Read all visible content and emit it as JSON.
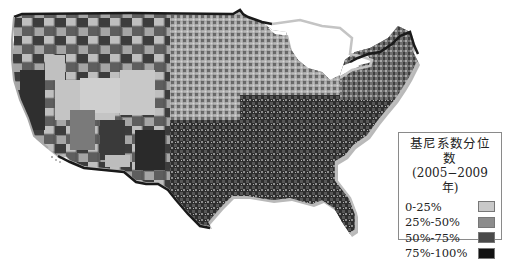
{
  "map": {
    "subject": "United States county map",
    "style": "grayscale choropleth"
  },
  "legend": {
    "title": "基尼系数分位数",
    "subtitle": "(2005−2009年)",
    "items": [
      {
        "label": "0-25%",
        "color": "#c9c9c9"
      },
      {
        "label": "25%-50%",
        "color": "#8c8c8c"
      },
      {
        "label": "50%-75%",
        "color": "#4a4a4a"
      },
      {
        "label": "75%-100%",
        "color": "#111111"
      }
    ]
  },
  "colors": {
    "border_dark": "#1a1a1a",
    "border_light": "#bdbdbd",
    "background": "#ffffff"
  }
}
